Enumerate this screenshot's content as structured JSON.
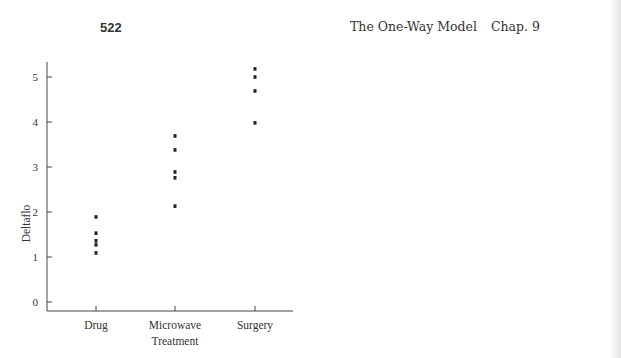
{
  "page": {
    "page_number": "522",
    "running_title": "The One-Way Model",
    "chapter": "Chap. 9"
  },
  "chart_data": [
    {
      "type": "scatter",
      "title": "",
      "xlabel": "Treatment",
      "ylabel": "Deltaflo",
      "categories": [
        "Drug",
        "Microwave",
        "Surgery"
      ],
      "yticks": [
        "0",
        "1",
        "2",
        "3",
        "4",
        "5"
      ],
      "ylim": [
        -0.2,
        5.4
      ],
      "grid": false,
      "legend": "none",
      "points": [
        {
          "category": "Drug",
          "values": [
            1.89,
            1.53,
            1.36,
            1.27,
            1.09
          ]
        },
        {
          "category": "Microwave",
          "values": [
            3.69,
            3.38,
            2.89,
            2.76,
            2.13
          ]
        },
        {
          "category": "Surgery",
          "values": [
            5.18,
            5.0,
            4.69,
            3.98
          ]
        }
      ]
    },
    {
      "type": "means-diamond",
      "title": "",
      "xlabel": "Treatment",
      "ylabel": "Deltaflo",
      "categories": [
        "Drug",
        "Microwave",
        "Surgery"
      ],
      "yticks": [
        "0",
        "1",
        "2",
        "3",
        "4",
        "5"
      ],
      "ylim": [
        -0.2,
        5.4
      ],
      "grid": false,
      "legend": "none",
      "diamonds": [
        {
          "category": "Drug",
          "mean": 1.46,
          "lower": 1.15,
          "upper": 1.75
        },
        {
          "category": "Microwave",
          "mean": 3.05,
          "lower": 2.53,
          "upper": 3.61
        },
        {
          "category": "Surgery",
          "mean": 4.75,
          "lower": 4.22,
          "upper": 5.25
        }
      ]
    }
  ]
}
